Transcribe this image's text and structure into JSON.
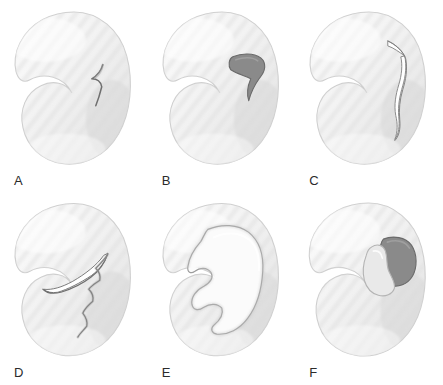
{
  "figure": {
    "view": "axial / superior view of C-shaped meniscus",
    "background_color": "#ffffff",
    "panel_count": 6,
    "rows": 2,
    "columns": 3,
    "width_px": 443,
    "height_px": 385
  },
  "style": {
    "body_fill_light": "#fbfbfb",
    "body_fill_mid": "#ededed",
    "body_fill_shadow": "#d8d8d8",
    "body_outline": "#cfcfcf",
    "stripe_color": "#dcdcdc",
    "tear_line_color": "#6f6f6f",
    "fragment_dark_fill": "#8a8a8a",
    "fragment_dark_outline": "#6a6a6a",
    "fragment_light_fill": "#e6e6e6",
    "label_color": "#2b2b2b",
    "label_font_size": "13px"
  },
  "panels": [
    {
      "id": "a",
      "label": "A",
      "tear_type": "small radial tear of the inner free edge",
      "tear_location": "posterior inner margin",
      "fragment_displaced": false,
      "fragment_shade": "none",
      "row": 1,
      "column": 1
    },
    {
      "id": "b",
      "label": "B",
      "tear_type": "flap tear with hooked undisplaced flap",
      "tear_location": "posterior horn inner third",
      "fragment_displaced": false,
      "fragment_shade": "dark",
      "row": 1,
      "column": 2
    },
    {
      "id": "c",
      "label": "C",
      "tear_type": "longitudinal vertical tear",
      "tear_location": "posterior horn, parallel to outer rim",
      "fragment_displaced": false,
      "fragment_shade": "none",
      "row": 1,
      "column": 3
    },
    {
      "id": "d",
      "label": "D",
      "tear_type": "oblique / complex tear with jagged margin",
      "tear_location": "body extending to posterior horn",
      "fragment_displaced": true,
      "fragment_shade": "none",
      "row": 2,
      "column": 1
    },
    {
      "id": "e",
      "label": "E",
      "tear_type": "bucket-handle tear with displaced inner fragment",
      "tear_location": "full length of inner meniscus",
      "fragment_displaced": true,
      "fragment_shade": "none",
      "row": 2,
      "column": 2
    },
    {
      "id": "f",
      "label": "F",
      "tear_type": "displaced flap tear with free fragment",
      "tear_location": "posterior horn, fragment folded centrally",
      "fragment_displaced": true,
      "fragment_shade": "dark",
      "row": 2,
      "column": 3
    }
  ]
}
